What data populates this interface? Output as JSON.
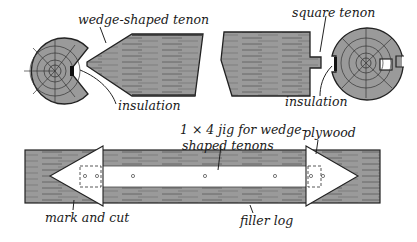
{
  "figure": {
    "colors": {
      "wood": "#9a9a9a",
      "wood_dark": "#555555",
      "line": "#222222",
      "paper": "#ffffff"
    },
    "labels": {
      "wedge_tenon": "wedge-shaped tenon",
      "insulation_left": "insulation",
      "square_tenon": "square tenon",
      "insulation_right": "insulation",
      "jig_line1": "1 × 4 jig for wedge-",
      "jig_line2": "shaped tenons",
      "plywood": "plywood",
      "mark_and_cut": "mark and cut",
      "filler_log": "filler log"
    }
  }
}
